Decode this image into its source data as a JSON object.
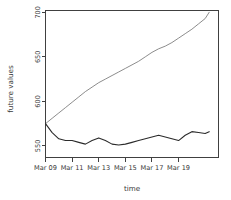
{
  "chart_data": {
    "type": "line",
    "title": "",
    "xlabel": "time",
    "ylabel": "future values",
    "grid": false,
    "legend": "none",
    "xlim": [
      0,
      13
    ],
    "ylim": [
      537,
      702
    ],
    "x_tick_labels": [
      "Mar 09",
      "Mar 11",
      "Mar 13",
      "Mar 15",
      "Mar 17",
      "Mar 19"
    ],
    "x_tick_values": [
      0,
      2,
      4,
      6,
      8,
      10
    ],
    "y_tick_labels": [
      "550",
      "600",
      "650",
      "700"
    ],
    "y_tick_values": [
      550,
      600,
      650,
      700
    ],
    "x_values": [
      0,
      0.5,
      1,
      1.5,
      2,
      2.5,
      3,
      3.5,
      4,
      4.5,
      5,
      5.5,
      6,
      6.5,
      7,
      7.5,
      8,
      8.5,
      9,
      9.5,
      10,
      10.5,
      11,
      11.5,
      12,
      12.3
    ],
    "series": [
      {
        "name": "upper-projection",
        "color": "#6f6f6f",
        "width": 0.8,
        "style": "thin",
        "values": [
          575,
          581,
          587,
          593,
          599,
          605,
          611,
          616,
          621,
          625,
          629,
          633,
          637,
          641,
          645,
          650,
          655,
          659,
          662,
          666,
          671,
          676,
          681,
          687,
          693,
          700
        ]
      },
      {
        "name": "observed-values",
        "color": "#2b2b2b",
        "width": 1.1,
        "style": "solid",
        "values": [
          575,
          565,
          558,
          556,
          556,
          554,
          552,
          556,
          559,
          556,
          552,
          551,
          552,
          554,
          556,
          558,
          560,
          562,
          560,
          558,
          556,
          562,
          566,
          565,
          564,
          566
        ]
      }
    ]
  },
  "axes": {
    "x_title": "time",
    "y_title": "future values"
  }
}
